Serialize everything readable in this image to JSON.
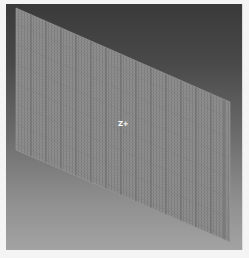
{
  "viewport": {
    "background_top": "#3a3a3a",
    "background_bottom": "#a3a3a3",
    "mesh": {
      "shape": "parallelogram",
      "fill": "#8c8c8c",
      "grid_line_color": "#6a6a6a",
      "corners": [
        [
          10,
          4
        ],
        [
          224,
          98
        ],
        [
          224,
          238
        ],
        [
          10,
          146
        ]
      ]
    },
    "axis_label": "Z+"
  }
}
